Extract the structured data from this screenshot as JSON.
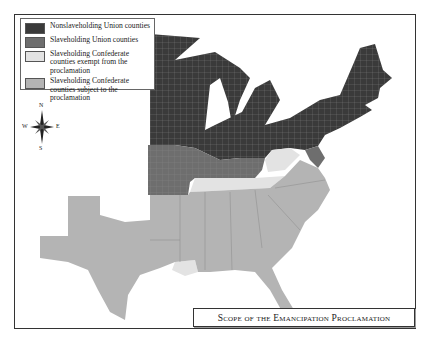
{
  "map": {
    "title": "Scope of the Emancipation Proclamation",
    "legend": [
      {
        "label": "Nonslaveholding Union counties",
        "color": "#3a3a3a"
      },
      {
        "label": "Slaveholding Union counties",
        "color": "#6e6e6e"
      },
      {
        "label": "Slaveholding Confederate counties exempt from the proclamation",
        "color": "#e3e3e3"
      },
      {
        "label": "Slaveholding Confederate counties subject to the proclamation",
        "color": "#b4b4b4"
      }
    ],
    "compass": {
      "n": "N",
      "s": "S",
      "e": "E",
      "w": "W"
    }
  }
}
